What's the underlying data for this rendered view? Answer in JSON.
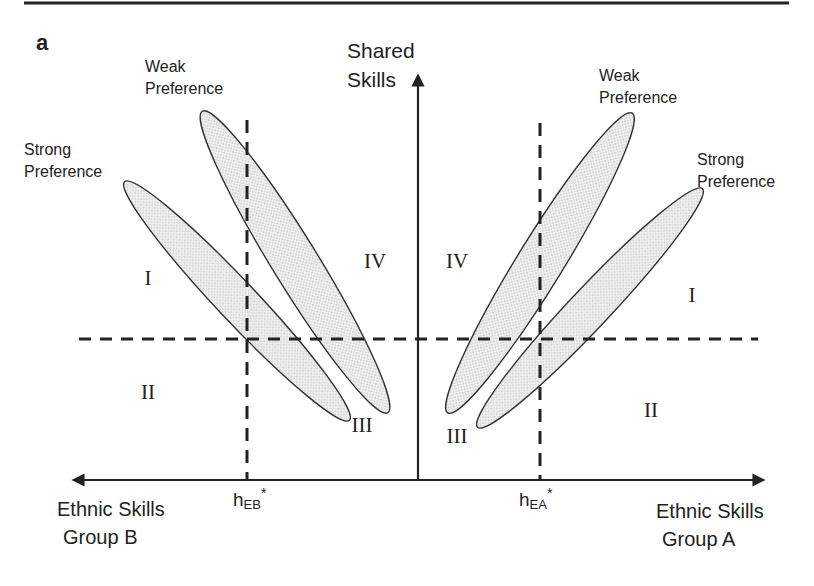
{
  "panel_label": "a",
  "axes": {
    "y_label_line1": "Shared",
    "y_label_line2": "Skills",
    "x_left_label_line1": "Ethnic Skills",
    "x_left_label_line2": "Group B",
    "x_right_label_line1": "Ethnic Skills",
    "x_right_label_line2": "Group A"
  },
  "thresholds": {
    "left": {
      "base": "h",
      "sub": "EB",
      "sup": "*"
    },
    "right": {
      "base": "h",
      "sub": "EA",
      "sup": "*"
    }
  },
  "ellipses": {
    "left_weak": {
      "label_line1": "Weak",
      "label_line2": "Preference"
    },
    "left_strong": {
      "label_line1": "Strong",
      "label_line2": "Preference"
    },
    "right_weak": {
      "label_line1": "Weak",
      "label_line2": "Preference"
    },
    "right_strong": {
      "label_line1": "Strong",
      "label_line2": "Preference"
    }
  },
  "quadrants": {
    "left": {
      "I": "I",
      "II": "II",
      "III": "III",
      "IV": "IV"
    },
    "right": {
      "I": "I",
      "II": "II",
      "III": "III",
      "IV": "IV"
    }
  },
  "colors": {
    "line": "#222222",
    "ellipse_fill": "#e6e6e6",
    "dot": "#b0b0b0"
  }
}
